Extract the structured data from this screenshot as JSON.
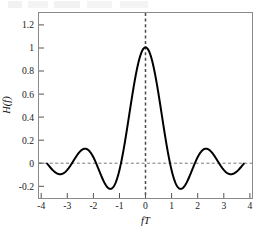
{
  "figure": {
    "background_color": "#ffffff",
    "frame_color": "#8a8a8a",
    "curve_color": "#000000",
    "guide_color": "#777777"
  },
  "chart_data": {
    "type": "line",
    "title": "",
    "subtitle": "",
    "xlabel": "fT",
    "ylabel": "H(f)",
    "xlim": [
      -4.35,
      4.35
    ],
    "ylim": [
      -0.3,
      1.3
    ],
    "xticks": [
      -4,
      -3,
      -2,
      -1,
      0,
      1,
      2,
      3,
      4
    ],
    "xtick_labels": [
      "-4",
      "-3",
      "-2",
      "-1",
      "0",
      "1",
      "2",
      "3",
      "4"
    ],
    "yticks": [
      -0.2,
      0,
      0.2,
      0.4,
      0.6,
      0.8,
      1,
      1.2
    ],
    "ytick_labels": [
      "-0.2",
      "0",
      "0.2",
      "0.4",
      "0.6",
      "0.8",
      "1",
      "1.2"
    ],
    "grid": false,
    "legend": null,
    "tick_direction": "in",
    "annotations": [
      {
        "name": "zero-line",
        "type": "hline",
        "y": 0,
        "style": "dashed"
      },
      {
        "name": "center-line",
        "type": "vline",
        "x": 0,
        "style": "dashed"
      }
    ],
    "series": [
      {
        "name": "sinc",
        "function": "sin(pi*fT)/(pi*fT)",
        "color": "#000000",
        "linewidth": 2,
        "x": [
          -4,
          -3.9,
          -3.8,
          -3.7,
          -3.6,
          -3.5,
          -3.4,
          -3.3,
          -3.2,
          -3.1,
          -3,
          -2.9,
          -2.8,
          -2.7,
          -2.6,
          -2.5,
          -2.4,
          -2.3,
          -2.2,
          -2.1,
          -2,
          -1.9,
          -1.8,
          -1.7,
          -1.6,
          -1.5,
          -1.4,
          -1.3,
          -1.2,
          -1.1,
          -1,
          -0.9,
          -0.8,
          -0.7,
          -0.6,
          -0.5,
          -0.4,
          -0.3,
          -0.2,
          -0.1,
          0,
          0.1,
          0.2,
          0.3,
          0.4,
          0.5,
          0.6,
          0.7,
          0.8,
          0.9,
          1,
          1.1,
          1.2,
          1.3,
          1.4,
          1.5,
          1.6,
          1.7,
          1.8,
          1.9,
          2,
          2.1,
          2.2,
          2.3,
          2.4,
          2.5,
          2.6,
          2.7,
          2.8,
          2.9,
          3,
          3.1,
          3.2,
          3.3,
          3.4,
          3.5,
          3.6,
          3.7,
          3.8,
          3.9,
          4
        ],
        "y": [
          0,
          -0.0253,
          -0.0491,
          -0.0698,
          -0.0858,
          -0.0955,
          -0.098,
          -0.0925,
          -0.079,
          -0.0583,
          -0.0318,
          -0.0016,
          0.0296,
          0.0594,
          0.085,
          0.1039,
          0.114,
          0.1139,
          0.1029,
          0.0812,
          0.0468,
          0.0161,
          -0.0182,
          -0.0541,
          -0.0894,
          -0.1212,
          -0.1457,
          -0.1606,
          -0.1643,
          -0.1554,
          -0.1336,
          -0.0991,
          -0.0531,
          0.0023,
          0.0647,
          0.1313,
          0.1988,
          0.2643,
          0.3245,
          0.3775,
          1,
          0.9836,
          0.9355,
          0.8584,
          0.7568,
          0.6366,
          0.5046,
          0.3679,
          0.2339,
          0.1093,
          0,
          -0.0894,
          -0.1559,
          -0.1981,
          -0.2162,
          -0.2122,
          -0.1891,
          -0.1512,
          -0.1039,
          -0.0527,
          0,
          0.0478,
          0.0874,
          0.1156,
          0.1304,
          0.1273,
          0.1174,
          0.0988,
          0.0737,
          0.0449,
          0,
          -0.0293,
          -0.0502,
          -0.0658,
          -0.0747,
          -0.0764,
          -0.0711,
          -0.0598,
          -0.0437,
          -0.0246,
          0
        ]
      }
    ]
  }
}
